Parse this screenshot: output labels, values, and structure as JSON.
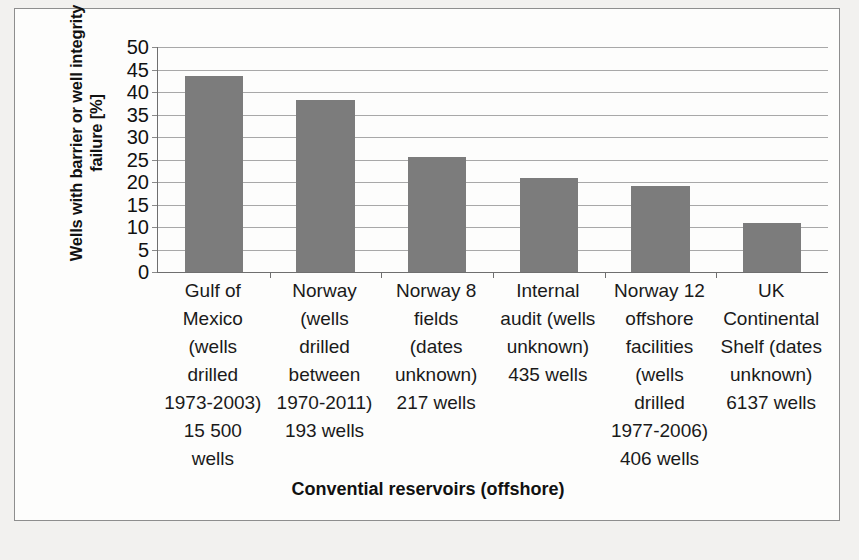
{
  "chart_data": {
    "type": "bar",
    "title": "",
    "xlabel": "Convential reservoirs (offshore)",
    "ylabel": "Wells with barrier or well integrity failure [%]",
    "ylim": [
      0,
      50
    ],
    "y_ticks": [
      0,
      5,
      10,
      15,
      20,
      25,
      30,
      35,
      40,
      45,
      50
    ],
    "grid": true,
    "legend": "none",
    "categories": [
      "Gulf of Mexico (wells drilled 1973-2003) 15 500 wells",
      "Norway (wells drilled between 1970-2011) 193 wells",
      "Norway 8 fields (dates unknown) 217 wells",
      "Internal audit (wells unknown) 435 wells",
      "Norway 12 offshore facilities (wells drilled 1977-2006) 406 wells",
      "UK Continental Shelf (dates unknown) 6137 wells"
    ],
    "values": [
      43.5,
      38.3,
      25.6,
      21.0,
      19.1,
      11.0
    ],
    "bar_color": "#7c7c7c",
    "gridline_color": "#a8a8a8",
    "axis_color": "#6f6f6f"
  },
  "axis": {
    "y_title": "Wells with barrier or well integrity failure [%]",
    "x_title": "Convential reservoirs (offshore)",
    "ticks": [
      "50",
      "45",
      "40",
      "35",
      "30",
      "25",
      "20",
      "15",
      "10",
      "5",
      "0"
    ]
  },
  "category_labels": [
    {
      "lines": [
        "Gulf of",
        "Mexico",
        "(wells",
        "drilled",
        "1973-2003)",
        "15 500",
        "wells"
      ]
    },
    {
      "lines": [
        "Norway",
        "(wells",
        "drilled",
        "between",
        "1970-2011)",
        "193 wells"
      ]
    },
    {
      "lines": [
        "Norway 8",
        "fields",
        "(dates",
        "unknown)",
        "217 wells"
      ]
    },
    {
      "lines": [
        "Internal",
        "audit (wells",
        "unknown)",
        "435 wells"
      ]
    },
    {
      "lines": [
        "Norway 12",
        "offshore",
        "facilities",
        "(wells",
        "drilled",
        "1977-2006)",
        "406 wells"
      ]
    },
    {
      "lines": [
        "UK",
        "Continental",
        "Shelf (dates",
        "unknown)",
        "6137 wells"
      ]
    }
  ]
}
